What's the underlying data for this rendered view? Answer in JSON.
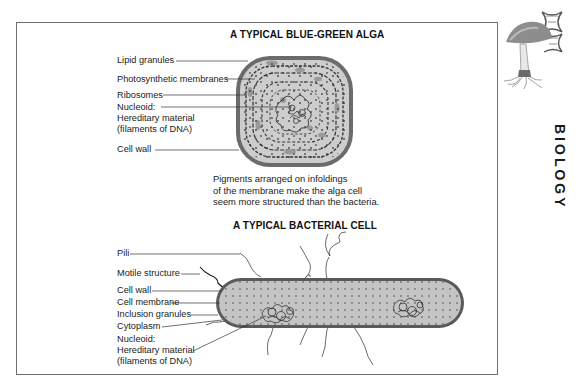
{
  "alga": {
    "title": "A TYPICAL BLUE-GREEN ALGA",
    "labels": {
      "lipid_granules": "Lipid granules",
      "photosynthetic_membranes": "Photosynthetic membranes",
      "ribosomes": "Ribosomes",
      "nucleoid_1": "Nucleoid:",
      "nucleoid_2": "Hereditary material",
      "nucleoid_3": "(filaments of DNA)",
      "cell_wall": "Cell wall"
    },
    "caption": "Pigments arranged on infoldings\nof the membrane make the alga cell\nseem more structured than the bacteria."
  },
  "bacteria": {
    "title": "A TYPICAL BACTERIAL CELL",
    "labels": {
      "pili": "Pili",
      "motile_structure": "Motile structure",
      "cell_wall": "Cell wall",
      "cell_membrane": "Cell membrane",
      "inclusion_granules": "Inclusion granules",
      "cytoplasm": "Cytoplasm",
      "nucleoid_1": "Nucleoid:",
      "nucleoid_2": "Hereditary material",
      "nucleoid_3": "(filaments of DNA)"
    }
  },
  "sidebar": {
    "title": "BIOLOGY",
    "logo_icon": "mushroom-dna-icon"
  },
  "colors": {
    "frame": "#6e6e6e",
    "cell_fill": "#c9c9c9",
    "cell_wall": "#555555",
    "text": "#1a1a1a"
  }
}
